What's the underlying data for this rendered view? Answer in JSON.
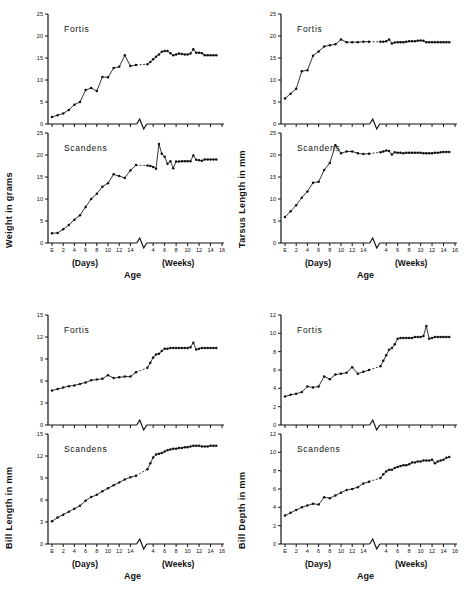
{
  "figure": {
    "axis_title": "Age",
    "days_label": "(Days)",
    "weeks_label": "(Weeks)",
    "species": {
      "fortis": "Fortis",
      "scandens": "Scandens"
    }
  },
  "panels": [
    {
      "key": "weight",
      "ylabel": "Weight in grams",
      "position": "top-left"
    },
    {
      "key": "tarsus",
      "ylabel": "Tarsus Length in mm",
      "position": "top-right"
    },
    {
      "key": "billlen",
      "ylabel": "Bill Length in mm",
      "position": "bottom-left"
    },
    {
      "key": "billdep",
      "ylabel": "Bill Depth in mm",
      "position": "bottom-right"
    }
  ],
  "chart_data": [
    {
      "type": "line",
      "title": "Weight in grams — Fortis",
      "panel": "weight",
      "species": "Fortis",
      "xlabel": "Age",
      "ylabel": "Weight in grams",
      "ylim": [
        0,
        25
      ],
      "yticks": [
        0,
        5,
        10,
        15,
        20,
        25
      ],
      "x_days_ticks": [
        "E",
        "2",
        "4",
        "6",
        "8",
        "10",
        "12",
        "14"
      ],
      "x_weeks_ticks": [
        "4",
        "6",
        "8",
        "10",
        "12",
        "14",
        "16"
      ],
      "axis_break": true,
      "grid": false,
      "legend": "none",
      "days": {
        "x": [
          0,
          1,
          2,
          3,
          4,
          5,
          6,
          7,
          8,
          9,
          10,
          11,
          12,
          13,
          14,
          15
        ],
        "y": [
          1.6,
          2.0,
          2.4,
          3.2,
          4.4,
          5.0,
          7.7,
          8.2,
          7.5,
          10.7,
          10.6,
          12.7,
          13.0,
          15.6,
          13.2,
          13.4
        ]
      },
      "weeks": {
        "x": [
          3,
          3.5,
          4,
          4.5,
          5,
          5.5,
          6,
          6.5,
          7,
          7.5,
          8,
          8.5,
          9,
          9.5,
          10,
          10.5,
          11,
          11.5,
          12,
          12.5,
          13,
          13.5,
          14,
          14.5,
          15
        ],
        "y": [
          13.6,
          14.1,
          14.7,
          15.3,
          15.8,
          16.4,
          16.6,
          16.6,
          16.1,
          15.6,
          15.8,
          16.0,
          15.9,
          15.8,
          15.8,
          16.0,
          17.0,
          16.2,
          16.2,
          16.1,
          15.6,
          15.6,
          15.6,
          15.6,
          15.6
        ]
      }
    },
    {
      "type": "line",
      "title": "Weight in grams — Scandens",
      "panel": "weight",
      "species": "Scandens",
      "xlabel": "Age",
      "ylabel": "Weight in grams",
      "ylim": [
        0,
        25
      ],
      "yticks": [
        0,
        5,
        10,
        15,
        20,
        25
      ],
      "x_days_ticks": [
        "E",
        "2",
        "4",
        "6",
        "8",
        "10",
        "12",
        "14"
      ],
      "x_weeks_ticks": [
        "4",
        "6",
        "8",
        "10",
        "12",
        "14",
        "16"
      ],
      "axis_break": true,
      "grid": false,
      "legend": "none",
      "days": {
        "x": [
          0,
          1,
          2,
          3,
          4,
          5,
          6,
          7,
          8,
          9,
          10,
          11,
          12,
          13,
          14,
          15
        ],
        "y": [
          2.2,
          2.3,
          3.1,
          4.1,
          5.3,
          6.3,
          8.2,
          10.0,
          11.2,
          12.8,
          13.6,
          15.6,
          15.2,
          14.8,
          16.5,
          17.7
        ]
      },
      "weeks": {
        "x": [
          3,
          3.5,
          4,
          4.5,
          5,
          5.5,
          6,
          6.5,
          7,
          7.5,
          8,
          8.5,
          9,
          9.5,
          10,
          10.5,
          11,
          11.5,
          12,
          12.5,
          13,
          13.5,
          14,
          14.5,
          15
        ],
        "y": [
          17.6,
          17.5,
          17.3,
          16.9,
          22.5,
          20.3,
          19.6,
          18.0,
          18.6,
          17.0,
          18.5,
          18.5,
          18.6,
          18.6,
          18.6,
          18.6,
          19.9,
          18.9,
          18.8,
          18.7,
          19.0,
          19.0,
          19.0,
          19.0,
          19.0
        ]
      }
    },
    {
      "type": "line",
      "title": "Tarsus Length in mm — Fortis",
      "panel": "tarsus",
      "species": "Fortis",
      "xlabel": "Age",
      "ylabel": "Tarsus Length in mm",
      "ylim": [
        0,
        25
      ],
      "yticks": [
        0,
        5,
        10,
        15,
        20,
        25
      ],
      "x_days_ticks": [
        "E",
        "2",
        "4",
        "6",
        "8",
        "10",
        "12",
        "14"
      ],
      "x_weeks_ticks": [
        "4",
        "6",
        "8",
        "10",
        "12",
        "14",
        "16"
      ],
      "axis_break": true,
      "grid": false,
      "legend": "none",
      "days": {
        "x": [
          0,
          1,
          2,
          3,
          4,
          5,
          6,
          7,
          8,
          9,
          10,
          11,
          12,
          13,
          14,
          15
        ],
        "y": [
          5.8,
          6.9,
          8.0,
          12.0,
          12.2,
          15.5,
          16.5,
          17.6,
          17.9,
          18.1,
          19.2,
          18.6,
          18.6,
          18.6,
          18.7,
          18.7
        ]
      },
      "weeks": {
        "x": [
          3,
          3.5,
          4,
          4.5,
          5,
          5.5,
          6,
          6.5,
          7,
          7.5,
          8,
          8.5,
          9,
          9.5,
          10,
          10.5,
          11,
          11.5,
          12,
          12.5,
          13,
          13.5,
          14,
          14.5,
          15
        ],
        "y": [
          18.7,
          18.7,
          18.8,
          19.2,
          18.3,
          18.5,
          18.6,
          18.6,
          18.6,
          18.7,
          18.8,
          18.8,
          18.8,
          18.9,
          19.0,
          18.9,
          18.6,
          18.6,
          18.6,
          18.6,
          18.6,
          18.6,
          18.6,
          18.6,
          18.6
        ]
      }
    },
    {
      "type": "line",
      "title": "Tarsus Length in mm — Scandens",
      "panel": "tarsus",
      "species": "Scandens",
      "xlabel": "Age",
      "ylabel": "Tarsus Length in mm",
      "ylim": [
        0,
        25
      ],
      "yticks": [
        0,
        5,
        10,
        15,
        20,
        25
      ],
      "x_days_ticks": [
        "E",
        "2",
        "4",
        "6",
        "8",
        "10",
        "12",
        "14"
      ],
      "x_weeks_ticks": [
        "4",
        "6",
        "8",
        "10",
        "12",
        "14",
        "16"
      ],
      "axis_break": true,
      "grid": false,
      "legend": "none",
      "days": {
        "x": [
          0,
          1,
          2,
          3,
          4,
          5,
          6,
          7,
          8,
          9,
          10,
          11,
          12,
          13,
          14,
          15
        ],
        "y": [
          5.9,
          7.2,
          8.6,
          10.3,
          11.7,
          13.7,
          13.9,
          16.6,
          18.2,
          22.2,
          20.4,
          20.8,
          20.8,
          20.4,
          20.2,
          20.3
        ]
      },
      "weeks": {
        "x": [
          3,
          3.5,
          4,
          4.5,
          5,
          5.5,
          6,
          6.5,
          7,
          7.5,
          8,
          8.5,
          9,
          9.5,
          10,
          10.5,
          11,
          11.5,
          12,
          12.5,
          13,
          13.5,
          14,
          14.5,
          15
        ],
        "y": [
          20.6,
          20.8,
          21.0,
          20.9,
          20.1,
          20.6,
          20.5,
          20.5,
          20.4,
          20.5,
          20.5,
          20.5,
          20.5,
          20.5,
          20.5,
          20.4,
          20.4,
          20.4,
          20.4,
          20.5,
          20.5,
          20.6,
          20.7,
          20.7,
          20.7
        ]
      }
    },
    {
      "type": "line",
      "title": "Bill Length in mm — Fortis",
      "panel": "billlen",
      "species": "Fortis",
      "xlabel": "Age",
      "ylabel": "Bill Length in mm",
      "ylim": [
        0,
        15
      ],
      "yticks": [
        0,
        3,
        6,
        9,
        12,
        15
      ],
      "x_days_ticks": [
        "E",
        "2",
        "4",
        "6",
        "8",
        "10",
        "12",
        "14"
      ],
      "x_weeks_ticks": [
        "4",
        "6",
        "8",
        "10",
        "12",
        "14",
        "16"
      ],
      "axis_break": true,
      "grid": false,
      "legend": "none",
      "days": {
        "x": [
          0,
          1,
          2,
          3,
          4,
          5,
          6,
          7,
          8,
          9,
          10,
          11,
          12,
          13,
          14,
          15
        ],
        "y": [
          4.7,
          4.9,
          5.1,
          5.3,
          5.4,
          5.6,
          5.8,
          6.1,
          6.2,
          6.3,
          6.8,
          6.4,
          6.5,
          6.6,
          6.6,
          7.2
        ]
      },
      "weeks": {
        "x": [
          3,
          3.5,
          4,
          4.5,
          5,
          5.5,
          6,
          6.5,
          7,
          7.5,
          8,
          8.5,
          9,
          9.5,
          10,
          10.5,
          11,
          11.5,
          12,
          12.5,
          13,
          13.5,
          14,
          14.5,
          15
        ],
        "y": [
          7.8,
          8.5,
          9.2,
          9.6,
          9.7,
          10.1,
          10.4,
          10.4,
          10.5,
          10.5,
          10.5,
          10.5,
          10.5,
          10.5,
          10.5,
          10.6,
          11.2,
          10.3,
          10.4,
          10.5,
          10.5,
          10.5,
          10.5,
          10.5,
          10.5
        ]
      }
    },
    {
      "type": "line",
      "title": "Bill Length in mm — Scandens",
      "panel": "billlen",
      "species": "Scandens",
      "xlabel": "Age",
      "ylabel": "Bill Length in mm",
      "ylim": [
        0,
        15
      ],
      "yticks": [
        0,
        3,
        6,
        9,
        12,
        15
      ],
      "x_days_ticks": [
        "E",
        "2",
        "4",
        "6",
        "8",
        "10",
        "12",
        "14"
      ],
      "x_weeks_ticks": [
        "4",
        "6",
        "8",
        "10",
        "12",
        "14",
        "16"
      ],
      "axis_break": true,
      "grid": false,
      "legend": "none",
      "days": {
        "x": [
          0,
          1,
          2,
          3,
          4,
          5,
          6,
          7,
          8,
          9,
          10,
          11,
          12,
          13,
          14,
          15
        ],
        "y": [
          3.1,
          3.6,
          4.0,
          4.4,
          4.8,
          5.2,
          5.9,
          6.4,
          6.7,
          7.2,
          7.6,
          8.0,
          8.4,
          8.8,
          9.1,
          9.3
        ]
      },
      "weeks": {
        "x": [
          3,
          3.5,
          4,
          4.5,
          5,
          5.5,
          6,
          6.5,
          7,
          7.5,
          8,
          8.5,
          9,
          9.5,
          10,
          10.5,
          11,
          11.5,
          12,
          12.5,
          13,
          13.5,
          14,
          14.5,
          15
        ],
        "y": [
          10.2,
          11.0,
          11.8,
          12.2,
          12.3,
          12.4,
          12.6,
          12.8,
          12.9,
          13.0,
          13.0,
          13.1,
          13.1,
          13.2,
          13.2,
          13.3,
          13.4,
          13.4,
          13.4,
          13.3,
          13.3,
          13.3,
          13.4,
          13.4,
          13.4
        ]
      }
    },
    {
      "type": "line",
      "title": "Bill Depth in mm — Fortis",
      "panel": "billdep",
      "species": "Fortis",
      "xlabel": "Age",
      "ylabel": "Bill Depth in mm",
      "ylim": [
        0,
        12
      ],
      "yticks": [
        0,
        2,
        4,
        6,
        8,
        10,
        12
      ],
      "x_days_ticks": [
        "E",
        "2",
        "4",
        "6",
        "8",
        "10",
        "12",
        "14"
      ],
      "x_weeks_ticks": [
        "4",
        "6",
        "8",
        "10",
        "12",
        "14",
        "16"
      ],
      "axis_break": true,
      "grid": false,
      "legend": "none",
      "days": {
        "x": [
          0,
          1,
          2,
          3,
          4,
          5,
          6,
          7,
          8,
          9,
          10,
          11,
          12,
          13,
          14,
          15
        ],
        "y": [
          3.1,
          3.3,
          3.4,
          3.6,
          4.2,
          4.1,
          4.2,
          5.3,
          5.0,
          5.5,
          5.6,
          5.7,
          6.3,
          5.6,
          5.8,
          6.0
        ]
      },
      "weeks": {
        "x": [
          3,
          3.5,
          4,
          4.5,
          5,
          5.5,
          6,
          6.5,
          7,
          7.5,
          8,
          8.5,
          9,
          9.5,
          10,
          10.5,
          11,
          11.5,
          12,
          12.5,
          13,
          13.5,
          14,
          14.5,
          15
        ],
        "y": [
          6.4,
          7.0,
          7.6,
          8.2,
          8.4,
          8.8,
          9.4,
          9.5,
          9.5,
          9.5,
          9.5,
          9.5,
          9.6,
          9.6,
          9.6,
          9.7,
          10.8,
          9.4,
          9.5,
          9.6,
          9.6,
          9.6,
          9.6,
          9.6,
          9.6
        ]
      }
    },
    {
      "type": "line",
      "title": "Bill Depth in mm — Scandens",
      "panel": "billdep",
      "species": "Scandens",
      "xlabel": "Age",
      "ylabel": "Bill Depth in mm",
      "ylim": [
        0,
        12
      ],
      "yticks": [
        0,
        2,
        4,
        6,
        8,
        10,
        12
      ],
      "x_days_ticks": [
        "E",
        "2",
        "4",
        "6",
        "8",
        "10",
        "12",
        "14"
      ],
      "x_weeks_ticks": [
        "4",
        "6",
        "8",
        "10",
        "12",
        "14",
        "16"
      ],
      "axis_break": true,
      "grid": false,
      "legend": "none",
      "days": {
        "x": [
          0,
          1,
          2,
          3,
          4,
          5,
          6,
          7,
          8,
          9,
          10,
          11,
          12,
          13,
          14,
          15
        ],
        "y": [
          3.1,
          3.4,
          3.7,
          4.0,
          4.2,
          4.4,
          4.3,
          5.1,
          5.0,
          5.3,
          5.6,
          5.9,
          6.0,
          6.2,
          6.6,
          6.8
        ]
      },
      "weeks": {
        "x": [
          3,
          3.5,
          4,
          4.5,
          5,
          5.5,
          6,
          6.5,
          7,
          7.5,
          8,
          8.5,
          9,
          9.5,
          10,
          10.5,
          11,
          11.5,
          12,
          12.5,
          13,
          13.5,
          14,
          14.5,
          15
        ],
        "y": [
          7.2,
          7.6,
          7.9,
          8.1,
          8.1,
          8.3,
          8.4,
          8.5,
          8.6,
          8.6,
          8.7,
          8.9,
          8.9,
          9.0,
          9.0,
          9.1,
          9.1,
          9.1,
          9.2,
          8.8,
          9.0,
          9.1,
          9.2,
          9.4,
          9.5
        ]
      }
    }
  ]
}
